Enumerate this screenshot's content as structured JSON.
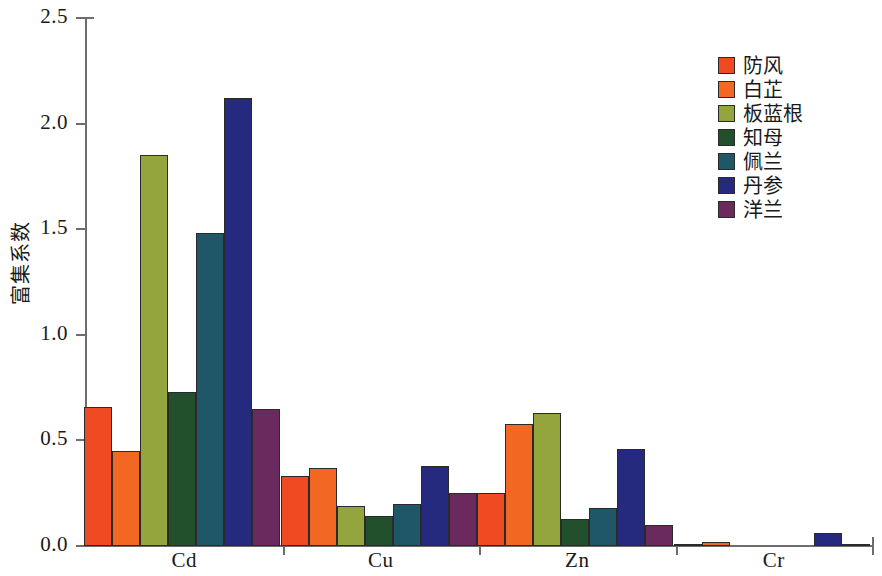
{
  "chart_data": {
    "type": "bar",
    "title": "",
    "xlabel": "",
    "ylabel": "富集系数",
    "ylim": [
      0.0,
      2.5
    ],
    "ytick_labels": [
      "0.0",
      "0.5",
      "1.0",
      "1.5",
      "2.0",
      "2.5"
    ],
    "ytick_values": [
      0.0,
      0.5,
      1.0,
      1.5,
      2.0,
      2.5
    ],
    "grid": false,
    "legend_position": "top-right",
    "categories": [
      "Cd",
      "Cu",
      "Zn",
      "Cr"
    ],
    "series": [
      {
        "name": "防风",
        "color": "#ef4a22",
        "values": [
          0.66,
          0.33,
          0.25,
          0.01
        ]
      },
      {
        "name": "白芷",
        "color": "#f26722",
        "values": [
          0.45,
          0.37,
          0.58,
          0.02
        ]
      },
      {
        "name": "板蓝根",
        "color": "#93a53c",
        "values": [
          1.85,
          0.19,
          0.63,
          0.0
        ]
      },
      {
        "name": "知母",
        "color": "#22502c",
        "values": [
          0.73,
          0.14,
          0.13,
          0.0
        ]
      },
      {
        "name": "佩兰",
        "color": "#1f5668",
        "values": [
          1.48,
          0.2,
          0.18,
          0.0
        ]
      },
      {
        "name": "丹参",
        "color": "#262a7e",
        "values": [
          2.12,
          0.38,
          0.46,
          0.06
        ]
      },
      {
        "name": "洋兰",
        "color": "#6b2a5e",
        "values": [
          0.65,
          0.25,
          0.1,
          0.01
        ]
      }
    ]
  },
  "axis": {
    "y_title": "富集系数"
  }
}
